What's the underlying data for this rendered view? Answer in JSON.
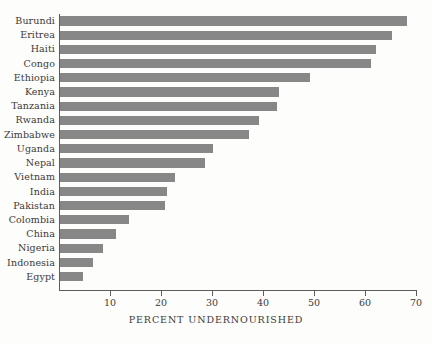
{
  "chart_data": {
    "type": "bar",
    "orientation": "horizontal",
    "title": "",
    "xlabel": "PERCENT UNDERNOURISHED",
    "ylabel": "",
    "xlim": [
      0,
      70
    ],
    "xticks": [
      0,
      10,
      20,
      30,
      40,
      50,
      60,
      70
    ],
    "xtick_labels": [
      "",
      "10",
      "20",
      "30",
      "40",
      "50",
      "60",
      "70"
    ],
    "grid": false,
    "legend": null,
    "bar_color": "#878787",
    "axis_color": "#5d5d5d",
    "background_color": "#fdfdfb",
    "categories": [
      "Burundi",
      "Eritrea",
      "Haiti",
      "Congo",
      "Ethiopia",
      "Kenya",
      "Tanzania",
      "Rwanda",
      "Zimbabwe",
      "Uganda",
      "Nepal",
      "Vietnam",
      "India",
      "Pakistan",
      "Colombia",
      "China",
      "Nigeria",
      "Indonesia",
      "Egypt"
    ],
    "values": [
      68,
      65,
      62,
      61,
      49,
      43,
      42.5,
      39,
      37,
      30,
      28.5,
      22.5,
      21,
      20.5,
      13.5,
      11,
      8.5,
      6.5,
      4.5
    ]
  }
}
